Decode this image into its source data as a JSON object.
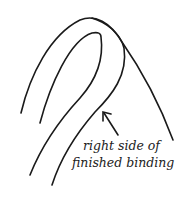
{
  "diagram": {
    "label_line1": "right side of",
    "label_line2": "finished binding",
    "stroke_color": "#1a1a1a",
    "background": "#ffffff"
  }
}
